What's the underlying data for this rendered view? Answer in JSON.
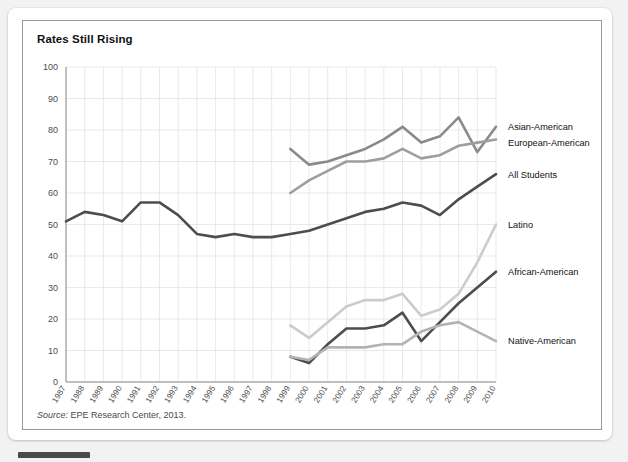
{
  "card": {
    "title": "Rates Still Rising",
    "source_prefix": "Source:",
    "source_text": "EPE Research Center, 2013."
  },
  "chart_data": {
    "type": "line",
    "title": "Rates Still Rising",
    "xlabel": "",
    "ylabel": "",
    "ylim": [
      0,
      100
    ],
    "ytick_step": 10,
    "grid": true,
    "legend_position": "right-inline-labels",
    "yticks": [
      0,
      10,
      20,
      30,
      40,
      50,
      60,
      70,
      80,
      90,
      100
    ],
    "categories": [
      "1987",
      "1988",
      "1989",
      "1990",
      "1991",
      "1992",
      "1993",
      "1994",
      "1995",
      "1996",
      "1997",
      "1998",
      "1999",
      "2000",
      "2001",
      "2002",
      "2003",
      "2004",
      "2005",
      "2006",
      "2007",
      "2008",
      "2009",
      "2010"
    ],
    "series": [
      {
        "name": "Asian-American",
        "color": "#8a8a8a",
        "start_year": "1999",
        "values": [
          null,
          null,
          null,
          null,
          null,
          null,
          null,
          null,
          null,
          null,
          null,
          null,
          74,
          69,
          70,
          72,
          74,
          77,
          81,
          76,
          78,
          84,
          73,
          81
        ]
      },
      {
        "name": "European-American",
        "color": "#9e9e9e",
        "start_year": "1999",
        "values": [
          null,
          null,
          null,
          null,
          null,
          null,
          null,
          null,
          null,
          null,
          null,
          null,
          60,
          64,
          67,
          70,
          70,
          71,
          74,
          71,
          72,
          75,
          76,
          77
        ]
      },
      {
        "name": "All Students",
        "color": "#4d4d4d",
        "start_year": "1987",
        "values": [
          51,
          54,
          53,
          51,
          57,
          57,
          53,
          47,
          46,
          47,
          46,
          46,
          47,
          48,
          50,
          52,
          54,
          55,
          57,
          56,
          53,
          58,
          62,
          66
        ]
      },
      {
        "name": "Latino",
        "color": "#cccccc",
        "start_year": "1999",
        "values": [
          null,
          null,
          null,
          null,
          null,
          null,
          null,
          null,
          null,
          null,
          null,
          null,
          18,
          14,
          19,
          24,
          26,
          26,
          28,
          21,
          23,
          28,
          38,
          50
        ]
      },
      {
        "name": "African-American",
        "color": "#4d4d4d",
        "start_year": "1999",
        "values": [
          null,
          null,
          null,
          null,
          null,
          null,
          null,
          null,
          null,
          null,
          null,
          null,
          8,
          6,
          12,
          17,
          17,
          18,
          22,
          13,
          19,
          25,
          30,
          35
        ]
      },
      {
        "name": "Native-American",
        "color": "#b3b3b3",
        "start_year": "1999",
        "values": [
          null,
          null,
          null,
          null,
          null,
          null,
          null,
          null,
          null,
          null,
          null,
          null,
          8,
          7,
          11,
          11,
          11,
          12,
          12,
          16,
          18,
          19,
          16,
          13
        ]
      }
    ],
    "series_label_positions": [
      {
        "name": "Asian-American",
        "y_value": 81
      },
      {
        "name": "European-American",
        "y_value": 76
      },
      {
        "name": "All Students",
        "y_value": 66
      },
      {
        "name": "Latino",
        "y_value": 50
      },
      {
        "name": "African-American",
        "y_value": 35
      },
      {
        "name": "Native-American",
        "y_value": 13
      }
    ]
  }
}
